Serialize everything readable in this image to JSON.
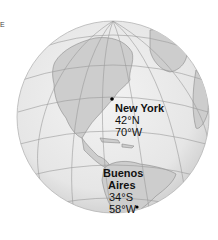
{
  "corner_mark": "E",
  "cities": [
    {
      "name": "New York",
      "lat": "42°N",
      "lon": "70°W"
    },
    {
      "name_line1": "Buenos",
      "name_line2": "Aires",
      "lat": "34°S",
      "lon": "58°W"
    }
  ],
  "colors": {
    "ocean": "#ececec",
    "land": "#cfcfcf",
    "grid": "#9a9a9a",
    "coast": "#8a8a8a",
    "text": "#111111"
  }
}
